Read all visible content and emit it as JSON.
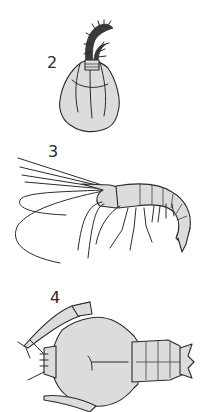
{
  "figures": [
    {
      "label": "2",
      "subject": "barnacle-like crustacean with feathery cirri"
    },
    {
      "label": "3",
      "subject": "shrimp in lateral view with long antennae"
    },
    {
      "label": "4",
      "subject": "mole-crab / squat lobster in dorsal view"
    }
  ],
  "colors": {
    "fill": "#dcdcdc",
    "stroke": "#2b2b2b",
    "background": "#ffffff"
  }
}
